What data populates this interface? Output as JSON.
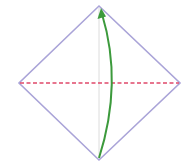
{
  "diagram": {
    "type": "origami-fold-step",
    "colors": {
      "paper_edge": "#a9a3d6",
      "valley_fold_line": "#e0486a",
      "center_crease": "#d8d8d8",
      "arrow": "#3c9a3c",
      "background": "#ffffff"
    },
    "vertices": {
      "top": [
        99,
        6
      ],
      "right": [
        180,
        83
      ],
      "bottom": [
        99,
        160
      ],
      "left": [
        19,
        83
      ]
    },
    "fold_line": {
      "style": "dashed",
      "from": [
        19,
        83
      ],
      "to": [
        180,
        83
      ]
    },
    "crease": {
      "style": "solid-faint",
      "from": [
        99,
        8
      ],
      "to": [
        99,
        158
      ]
    },
    "arrow": {
      "from": [
        99,
        158
      ],
      "control": [
        118,
        83
      ],
      "to": [
        101,
        10
      ],
      "direction": "up"
    }
  }
}
